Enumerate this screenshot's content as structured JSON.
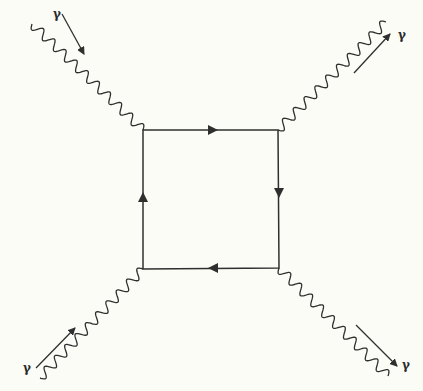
{
  "diagram": {
    "colors": {
      "background": "#fcfcf6",
      "line": "#2f2f2f"
    },
    "loop": {
      "corners": {
        "top_left": [
          143,
          130
        ],
        "top_right": [
          278,
          130
        ],
        "bottom_right": [
          279,
          268
        ],
        "bottom_left": [
          143,
          269
        ]
      },
      "arrows": [
        {
          "edge": "top",
          "direction": "right",
          "at": [
            213,
            130
          ]
        },
        {
          "edge": "right",
          "direction": "down",
          "at": [
            279,
            193
          ]
        },
        {
          "edge": "bottom",
          "direction": "left",
          "at": [
            213,
            268
          ]
        },
        {
          "edge": "left",
          "direction": "up",
          "at": [
            143,
            197
          ]
        }
      ]
    },
    "photons": [
      {
        "id": "top-left",
        "label": "γ",
        "direction": "incoming",
        "from": [
          32,
          24
        ],
        "to": [
          143,
          130
        ]
      },
      {
        "id": "top-right",
        "label": "γ",
        "direction": "outgoing",
        "from": [
          278,
          130
        ],
        "to": [
          386,
          22
        ]
      },
      {
        "id": "bottom-left",
        "label": "γ",
        "direction": "incoming",
        "from": [
          40,
          378
        ],
        "to": [
          143,
          269
        ]
      },
      {
        "id": "bottom-right",
        "label": "γ",
        "direction": "outgoing",
        "from": [
          279,
          268
        ],
        "to": [
          388,
          376
        ]
      }
    ],
    "labels": {
      "top_left": "γ",
      "top_right": "γ",
      "bottom_left": "γ",
      "bottom_right": "γ"
    }
  }
}
